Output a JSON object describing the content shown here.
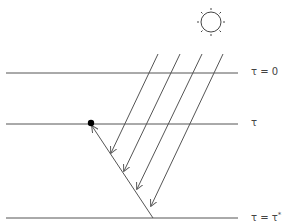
{
  "diagram": {
    "title": "",
    "levels": [
      {
        "id": "top",
        "label": "τ = 0"
      },
      {
        "id": "mid",
        "label": "τ"
      },
      {
        "id": "bottom",
        "label_main": "τ = τ",
        "label_sup": "*"
      }
    ],
    "sun_icon": "sun-icon",
    "incoming_rays_count": 4,
    "colors": {
      "line": "#555555",
      "dot": "#000000",
      "background": "#ffffff"
    }
  }
}
